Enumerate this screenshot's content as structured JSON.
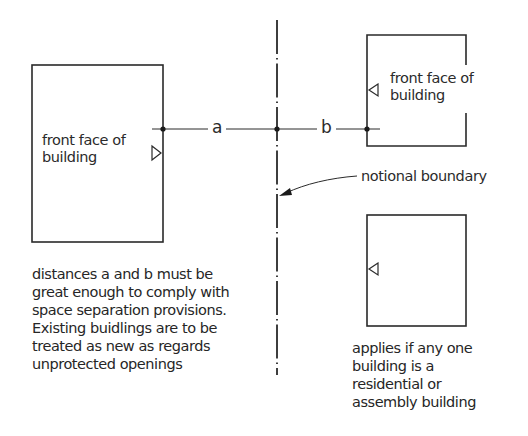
{
  "diagram": {
    "left_building": {
      "label_line1": "front face of",
      "label_line2": "building"
    },
    "right_upper_building": {
      "label_line1": "front face of",
      "label_line2": "building"
    },
    "right_lower_building": {
      "label_line1": "",
      "label_line2": ""
    },
    "dimensions": {
      "a": "a",
      "b": "b"
    },
    "boundary_label": "notional boundary",
    "left_note": {
      "lines": [
        "distances a and b must be",
        "great enough to comply with",
        "space separation provisions.",
        "Existing buidlings are to be",
        "treated as new as regards",
        "unprotected openings"
      ]
    },
    "right_note": {
      "lines": [
        "applies if any one",
        "building is a",
        "residential or",
        "assembly building"
      ]
    },
    "colors": {
      "line": "#2a2a2a",
      "background": "#ffffff"
    }
  }
}
